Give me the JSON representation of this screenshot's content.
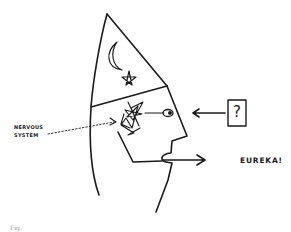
{
  "diagram": {
    "labels": {
      "nervous_line1": "NERVOUS",
      "nervous_line2": "SYSTEM",
      "eureka": "EUREKA!",
      "question_mark": "?",
      "figure_caption": "Fig."
    },
    "elements": [
      "wizard-hat-head-profile",
      "moon-symbol",
      "star-symbol",
      "nervous-system-scribble",
      "eye",
      "question-box-input",
      "input-arrow",
      "output-arrow-from-mouth"
    ],
    "colors": {
      "ink": "#1a1a1a",
      "background": "#ffffff"
    }
  }
}
